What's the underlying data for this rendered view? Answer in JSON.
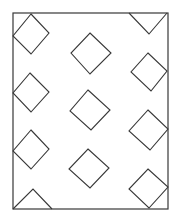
{
  "diagram": {
    "stroke_color": "#383838",
    "background_color": "#ffffff",
    "frame": {
      "x1": 13,
      "y1": 13,
      "x2": 168,
      "y2": 209
    },
    "shapes": [
      {
        "id": "diamond-left-1",
        "type": "diamond",
        "points": "31,14 49,33 31,54 13,36"
      },
      {
        "id": "diamond-left-2",
        "type": "diamond",
        "points": "30,73 49,92 31,112 13,93"
      },
      {
        "id": "diamond-left-3",
        "type": "diamond",
        "points": "31,130 49,149 31,169 13,151"
      },
      {
        "id": "triangle-bottom-left",
        "type": "triangle",
        "points": "13,209 33,189 52,209"
      },
      {
        "id": "diamond-mid-1",
        "type": "diamond",
        "points": "90,33 111,53 90,74 71,53"
      },
      {
        "id": "diamond-mid-2",
        "type": "diamond",
        "points": "88,90 110,110 91,130 70,111"
      },
      {
        "id": "diamond-mid-3",
        "type": "diamond",
        "points": "88,149 109,168 90,188 69,169"
      },
      {
        "id": "triangle-top-right",
        "type": "triangle",
        "points": "129,13 149,34 167,13"
      },
      {
        "id": "diamond-right-1",
        "type": "diamond",
        "points": "148,53 167,71 151,91 131,72"
      },
      {
        "id": "diamond-right-2",
        "type": "diamond",
        "points": "148,110 168,129 150,150 129,131"
      },
      {
        "id": "diamond-right-3",
        "type": "diamond",
        "points": "148,169 168,187 149,208 129,189"
      }
    ]
  }
}
